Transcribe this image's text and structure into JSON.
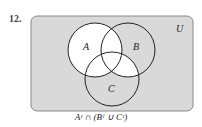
{
  "problem_number": "12.",
  "universe_label": "U",
  "sets": [
    {
      "label": "A",
      "cx": 95,
      "cy": 50,
      "r": 27
    },
    {
      "label": "B",
      "cx": 128,
      "cy": 50,
      "r": 27
    },
    {
      "label": "C",
      "cx": 112,
      "cy": 79,
      "r": 27
    }
  ],
  "expression": "Aᶜ ∩ (Bᶜ ∪ Cᶜ)",
  "colors": {
    "shaded": "#d9d9d9",
    "unshaded": "#ffffff",
    "stroke": "#222222",
    "frame": "#888888"
  }
}
